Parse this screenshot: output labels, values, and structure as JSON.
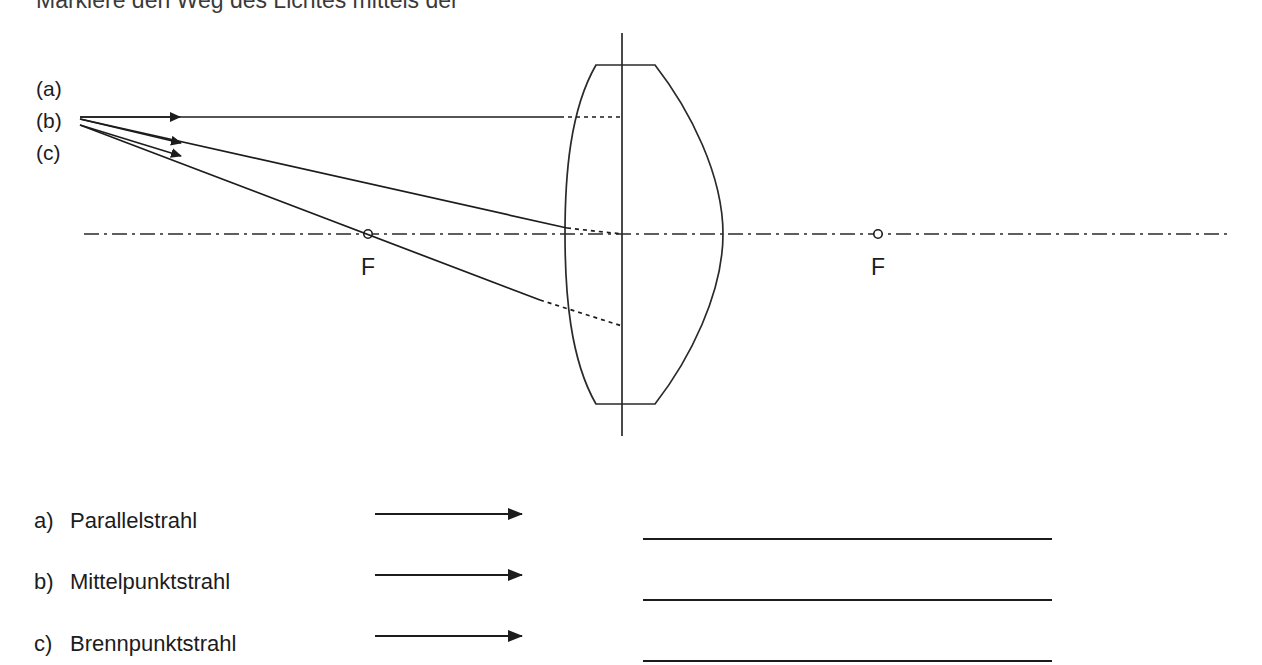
{
  "page": {
    "background_color": "#ffffff",
    "ink_color": "#1c1c1c",
    "width": 1262,
    "height": 665
  },
  "heading": {
    "text": "Markiere den Weg des Lichtes mittels der",
    "note": "clipped at top edge of page"
  },
  "diagram": {
    "ray_labels": [
      {
        "id": "a",
        "text": "(a)"
      },
      {
        "id": "b",
        "text": "(b)"
      },
      {
        "id": "c",
        "text": "(c)"
      }
    ],
    "focal_points": [
      {
        "id": "F-left",
        "label": "F"
      },
      {
        "id": "F-right",
        "label": "F"
      }
    ],
    "axis": {
      "style": "dash-dot",
      "name": "optical-axis"
    },
    "lens": {
      "name": "converging-lens",
      "type": "biconvex"
    },
    "rays": [
      {
        "id": "a",
        "style": "solid-then-dotted"
      },
      {
        "id": "b",
        "style": "solid-then-dotted"
      },
      {
        "id": "c",
        "style": "solid-then-dotted"
      }
    ]
  },
  "legend": {
    "items": [
      {
        "marker": "a)",
        "label": "Parallelstrahl"
      },
      {
        "marker": "b)",
        "label": "Mittelpunktstrahl"
      },
      {
        "marker": "c)",
        "label": "Brennpunktstrahl"
      }
    ],
    "arrow_icon": "arrow-right-icon",
    "answer_lines": 3
  }
}
